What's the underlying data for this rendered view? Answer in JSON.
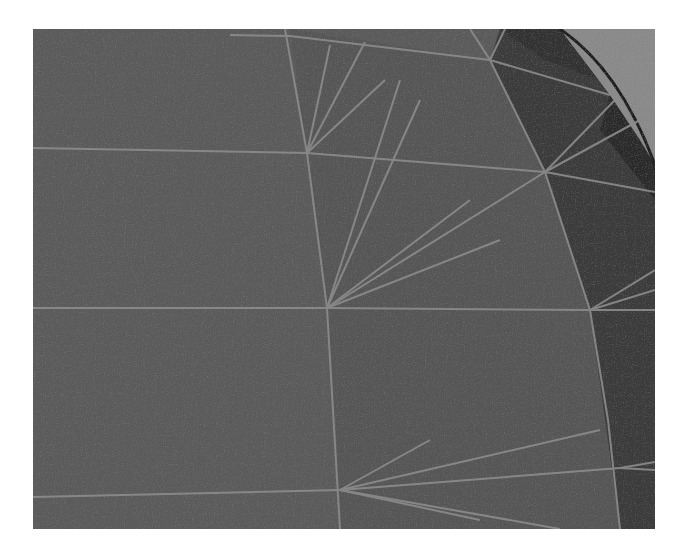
{
  "image": {
    "subject": "3D wireframe mesh rendering (close-up of curved surface with radial triangle fans)",
    "colors": {
      "background": "#ffffff",
      "flat_face": "#5b5b5b",
      "fan_face": "#565656",
      "dark_face": "#3a3a3a",
      "darker_face": "#2e2e2e",
      "outer_region": "#8a8a8a",
      "edge_line": "#8c8c8c"
    }
  }
}
